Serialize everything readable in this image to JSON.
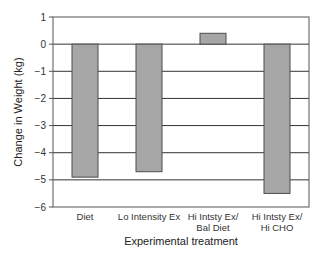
{
  "chart_data": {
    "type": "bar",
    "title": "",
    "xlabel": "Experimental treatment",
    "ylabel": "Change in Weight (kg)",
    "ylim": [
      -6,
      1
    ],
    "yticks": [
      1,
      0,
      -1,
      -2,
      -3,
      -4,
      -5,
      -6
    ],
    "grid": true,
    "legend": null,
    "categories": [
      "Diet",
      "Lo Intensity Ex",
      "Hi Intsty Ex/ Bal Diet",
      "Hi Intsty Ex/ Hi CHO"
    ],
    "category_lines": [
      [
        "Diet"
      ],
      [
        "Lo Intensity Ex"
      ],
      [
        "Hi Intsty Ex/",
        "Bal Diet"
      ],
      [
        "Hi Intsty Ex/",
        "Hi CHO"
      ]
    ],
    "values": [
      -4.9,
      -4.7,
      0.4,
      -5.5
    ],
    "colors": {
      "bar": "#a6a6a6",
      "bar_edge": "#4d4d4d",
      "grid": "#333333",
      "frame": "#555555"
    }
  }
}
